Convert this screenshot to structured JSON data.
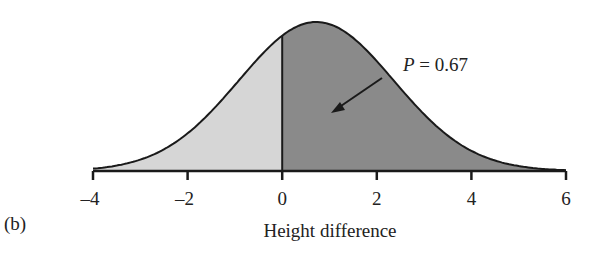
{
  "panel_label": "(b)",
  "chart_data": {
    "type": "area",
    "title": "",
    "xlabel": "Height difference",
    "ylabel": "",
    "xlim": [
      -4,
      6
    ],
    "x_ticks": [
      -4,
      -2,
      0,
      2,
      4,
      6
    ],
    "x_tick_labels": [
      "–4",
      "–2",
      "0",
      "2",
      "4",
      "6"
    ],
    "distribution": {
      "kind": "normal",
      "mean": 0.72,
      "sd": 1.64
    },
    "shaded_regions": [
      {
        "name": "below zero",
        "from": -4,
        "to": 0,
        "color": "#d6d6d6"
      },
      {
        "name": "above zero",
        "from": 0,
        "to": 6,
        "color": "#8a8a8a",
        "probability": 0.67
      }
    ],
    "annotation": {
      "text_italic": "P",
      "text_rest": " = 0.67",
      "arrow_to_region": "above zero"
    },
    "grid": false,
    "legend": null
  }
}
